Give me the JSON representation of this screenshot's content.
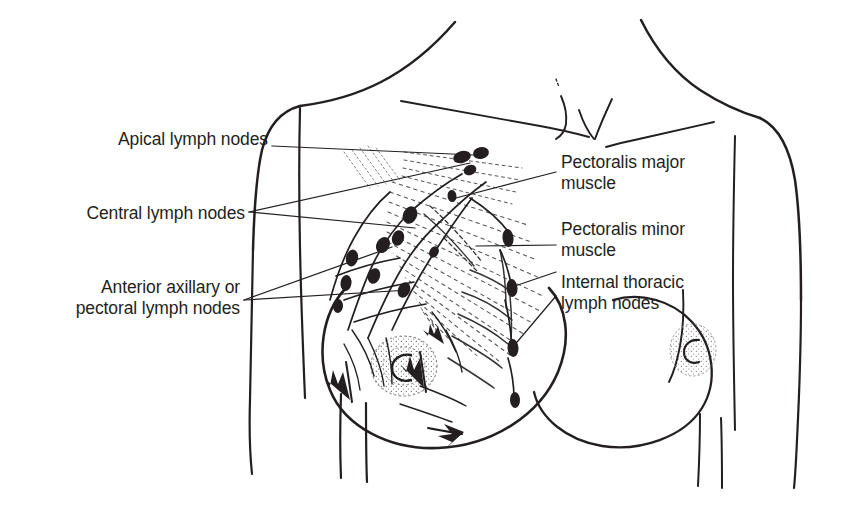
{
  "figure": {
    "type": "anatomical-diagram",
    "view": "anterior female chest",
    "ink_color": "#231f20",
    "background_color": "#ffffff"
  },
  "labels": {
    "left": [
      {
        "id": "apical",
        "name": "apical-lymph-nodes",
        "lines": [
          "Apical lymph nodes"
        ],
        "x": 57,
        "y": 129,
        "leaders": [
          [
            272,
            146
          ],
          [
            474,
            155
          ]
        ]
      },
      {
        "id": "central",
        "name": "central-lymph-nodes",
        "lines": [
          "Central lymph nodes"
        ],
        "x": 40,
        "y": 203,
        "leaders": [
          [
            249,
            212
          ],
          [
            415,
            228
          ]
        ]
      },
      {
        "id": "anterior_axillary",
        "name": "anterior-axillary-or-pectoral-lymph-nodes",
        "lines": [
          "Anterior axillary or",
          "pectoral lymph nodes"
        ],
        "x": 25,
        "y": 277,
        "leaders": [
          [
            244,
            300
          ],
          [
            409,
            290
          ]
        ]
      }
    ],
    "right": [
      {
        "id": "pec_major",
        "name": "pectoralis-major-muscle",
        "lines": [
          "Pectoralis major",
          "muscle"
        ],
        "x": 561,
        "y": 152,
        "leaders": [
          [
            540,
            175
          ],
          [
            452,
            199
          ]
        ]
      },
      {
        "id": "pec_minor",
        "name": "pectoralis-minor-muscle",
        "lines": [
          "Pectoralis minor",
          "muscle"
        ],
        "x": 561,
        "y": 219,
        "leaders": [
          [
            543,
            246
          ],
          [
            476,
            246
          ]
        ]
      },
      {
        "id": "internal_thoracic",
        "name": "internal-thoracic-lymph-nodes",
        "lines": [
          "Internal thoracic",
          "lymph nodes"
        ],
        "x": 561,
        "y": 272,
        "leaders": [
          [
            541,
            276
          ],
          [
            503,
            288
          ]
        ]
      }
    ]
  },
  "anatomy": {
    "body_outline": "female torso, head omitted, both arms at sides",
    "breasts": [
      "left breast with lymphatic network",
      "right breast plain outline"
    ],
    "node_groups": [
      "apical lymph nodes",
      "central lymph nodes",
      "anterior axillary (pectoral) lymph nodes",
      "internal thoracic lymph nodes"
    ],
    "muscles": [
      "pectoralis major",
      "pectoralis minor"
    ],
    "flow_arrows": 4
  }
}
